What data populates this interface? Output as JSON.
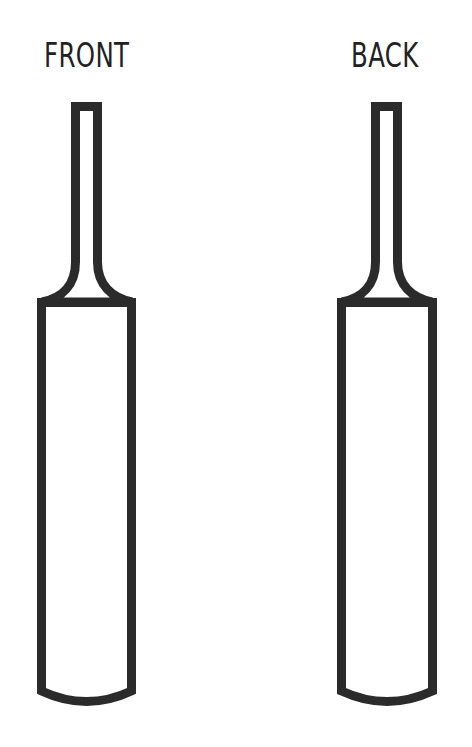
{
  "labels": {
    "front": "FRONT",
    "back": "BACK"
  },
  "colors": {
    "stroke": "#2b2b2b",
    "fill": "#ffffff",
    "background": "#ffffff"
  },
  "bats": [
    {
      "name": "front",
      "label": "FRONT"
    },
    {
      "name": "back",
      "label": "BACK"
    }
  ]
}
